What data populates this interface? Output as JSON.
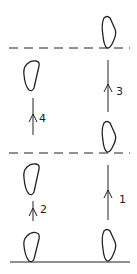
{
  "diagram": {
    "colors": {
      "stroke": "#222222",
      "background": "#ffffff"
    },
    "lines": {
      "dashed_upper_y": 48,
      "dashed_lower_y": 153,
      "baseline_y": 262,
      "x_start": 9,
      "x_end": 130
    },
    "shapes": [
      {
        "id": "left-upper",
        "x": 23,
        "y": 60,
        "w": 17,
        "h": 31
      },
      {
        "id": "left-middle",
        "x": 23,
        "y": 163,
        "w": 17,
        "h": 32
      },
      {
        "id": "left-bottom",
        "x": 23,
        "y": 231,
        "w": 17,
        "h": 31
      },
      {
        "id": "right-top",
        "x": 101,
        "y": 16,
        "w": 15,
        "h": 33
      },
      {
        "id": "right-middle",
        "x": 101,
        "y": 121,
        "w": 15,
        "h": 32
      },
      {
        "id": "right-bottom",
        "x": 101,
        "y": 229,
        "w": 15,
        "h": 33
      }
    ],
    "arrows": [
      {
        "label": "1",
        "x": 108,
        "y1": 220,
        "y2": 165,
        "head_y": 193,
        "label_x": 120,
        "label_y": 202
      },
      {
        "label": "2",
        "x": 33,
        "y1": 221,
        "y2": 201,
        "head_y": 212,
        "label_x": 41,
        "label_y": 212
      },
      {
        "label": "3",
        "x": 108,
        "y1": 112,
        "y2": 60,
        "head_y": 85,
        "label_x": 117,
        "label_y": 94
      },
      {
        "label": "4",
        "x": 33,
        "y1": 135,
        "y2": 98,
        "head_y": 118,
        "label_x": 40,
        "label_y": 121
      }
    ],
    "labels": {
      "arrow_1": "1",
      "arrow_2": "2",
      "arrow_3": "3",
      "arrow_4": "4"
    }
  }
}
